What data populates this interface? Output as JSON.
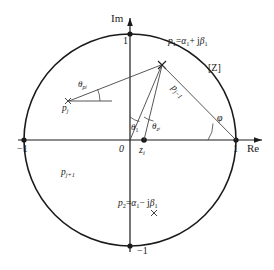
{
  "figure": {
    "type": "unit-circle-pole-zero-diagram",
    "plane_label": "[Z]",
    "axes": {
      "real_axis_label": "Re",
      "imag_axis_label": "Im",
      "ticks": {
        "re_neg1": "−1",
        "re_pos1": "1",
        "im_pos1": "1",
        "im_neg1": "−1",
        "origin": "0"
      }
    },
    "points": {
      "p1": {
        "label_p": "p",
        "label_sub": "1",
        "equals": "=",
        "alpha": "α",
        "alpha_sub": "1",
        "plus": "+ j",
        "beta": "β",
        "beta_sub": "1",
        "full_label": "p₁=α₁+ jβ₁",
        "marker": "cross"
      },
      "p2": {
        "label_p": "p",
        "label_sub": "2",
        "equals": "=",
        "alpha": "α",
        "alpha_sub": "1",
        "minus": "− j",
        "beta": "β",
        "beta_sub": "1",
        "full_label": "p₂=α₁− jβ₁",
        "marker": "cross"
      },
      "pj": {
        "base": "p",
        "sub": "j",
        "marker": "cross"
      },
      "pj_minus_1": {
        "base": "p",
        "sub": "j−1"
      },
      "pj_plus_1": {
        "base": "p",
        "sub": "j+1"
      },
      "zi": {
        "base": "z",
        "sub": "i",
        "marker": "dot"
      }
    },
    "angles": {
      "theta_pj": {
        "base": "θ",
        "sub": "p",
        "sub_sub": "j"
      },
      "theta_1": {
        "base": "θ",
        "sub": "1"
      },
      "theta_zi": {
        "base": "θ",
        "sub": "z",
        "sub_sub": "i"
      },
      "phi": {
        "symbol": "φ"
      }
    },
    "colors": {
      "stroke": "#1a1a1a",
      "background": "#ffffff",
      "thin_stroke": "#444444"
    }
  }
}
